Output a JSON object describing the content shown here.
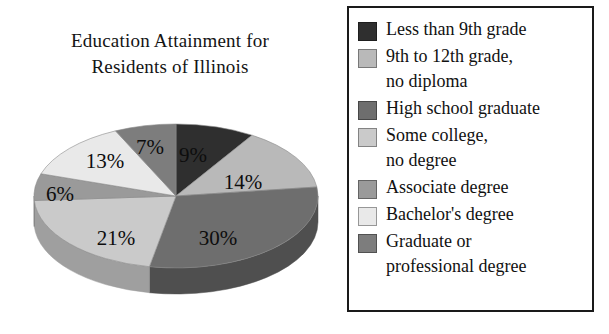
{
  "chart_data": {
    "type": "pie",
    "title": "Education Attainment for Residents of Illinois",
    "title_lines": [
      "Education Attainment for",
      "Residents of Illinois"
    ],
    "units": "percent",
    "categories": [
      "Less than 9th grade",
      "9th to 12th grade, no diploma",
      "High school graduate",
      "Some college, no degree",
      "Associate degree",
      "Bachelor's degree",
      "Graduate or professional degree"
    ],
    "values": [
      9,
      14,
      30,
      21,
      6,
      13,
      7
    ],
    "data_labels": [
      "9%",
      "14%",
      "30%",
      "21%",
      "6%",
      "13%",
      "7%"
    ],
    "colors": [
      "#2f2f2f",
      "#b9b9b9",
      "#6e6e6e",
      "#cacaca",
      "#9a9a9a",
      "#e9e9e9",
      "#7d7d7d"
    ],
    "start_angle_deg": 0,
    "direction": "clockwise",
    "three_d": true,
    "grid": false,
    "legend_position": "right",
    "legend_border_color": "#1a1a1a"
  },
  "chart": {
    "title_line1": "Education Attainment for",
    "title_line2": "Residents of Illinois",
    "slices": [
      {
        "label": "9%",
        "value": 9,
        "color": "#2f2f2f",
        "side": "#1e1e1e",
        "lx": 165,
        "ly": 44
      },
      {
        "label": "14%",
        "value": 14,
        "color": "#b9b9b9",
        "side": "#8f8f8f",
        "lx": 215,
        "ly": 71
      },
      {
        "label": "30%",
        "value": 30,
        "color": "#6e6e6e",
        "side": "#4f4f4f",
        "lx": 190,
        "ly": 127
      },
      {
        "label": "21%",
        "value": 21,
        "color": "#cacaca",
        "side": "#9f9f9f",
        "lx": 88,
        "ly": 127
      },
      {
        "label": "6%",
        "value": 6,
        "color": "#9a9a9a",
        "side": "#757575",
        "lx": 32,
        "ly": 83
      },
      {
        "label": "13%",
        "value": 13,
        "color": "#e9e9e9",
        "side": "#b5b5b5",
        "lx": 77,
        "ly": 50
      },
      {
        "label": "7%",
        "value": 7,
        "color": "#7d7d7d",
        "side": "#5c5c5c",
        "lx": 122,
        "ly": 36
      }
    ]
  },
  "legend": {
    "items": [
      {
        "swatch": "#2f2f2f",
        "text": "Less than 9th grade"
      },
      {
        "swatch": "#b9b9b9",
        "text": "9th to 12th grade,\nno diploma"
      },
      {
        "swatch": "#6e6e6e",
        "text": "High school graduate"
      },
      {
        "swatch": "#cacaca",
        "text": "Some college,\nno degree"
      },
      {
        "swatch": "#9a9a9a",
        "text": "Associate degree"
      },
      {
        "swatch": "#e9e9e9",
        "text": "Bachelor's degree"
      },
      {
        "swatch": "#7d7d7d",
        "text": "Graduate or\nprofessional degree"
      }
    ]
  }
}
